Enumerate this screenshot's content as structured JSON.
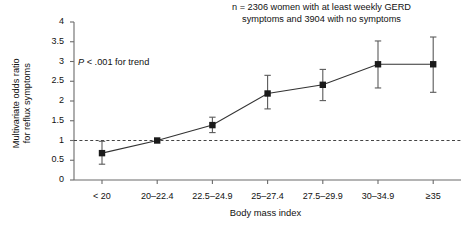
{
  "figure": {
    "annotation_note": "n = 2306 women with at least weekly GERD\nsymptoms and 3904 with no symptoms",
    "pvalue_italic": "P",
    "pvalue_rest": " < .001 for trend"
  },
  "chart_data": {
    "type": "line",
    "title": "",
    "subtitle": "n = 2306 women with at least weekly GERD symptoms and 3904 with no symptoms",
    "xlabel": "Body mass index",
    "ylabel": "Multivariate odds ratio\nfor reflux symptoms",
    "ylabel_lines": [
      "Multivariate odds ratio",
      "for reflux symptoms"
    ],
    "categories": [
      "< 20",
      "20–22.4",
      "22.5–24.9",
      "25–27.4",
      "27.5–29.9",
      "30–34.9",
      "≥35"
    ],
    "values": [
      0.68,
      1.0,
      1.39,
      2.19,
      2.41,
      2.93,
      2.93
    ],
    "ci_low": [
      0.4,
      1.0,
      1.2,
      1.8,
      2.01,
      2.33,
      2.22
    ],
    "ci_high": [
      0.98,
      1.0,
      1.59,
      2.65,
      2.8,
      3.52,
      3.62
    ],
    "ylim": [
      0,
      4
    ],
    "yticks": [
      "0",
      "0.5",
      "1",
      "1.5",
      "2",
      "2.5",
      "3",
      "3.5",
      "4"
    ],
    "ytick_values": [
      0,
      0.5,
      1,
      1.5,
      2,
      2.5,
      3,
      3.5,
      4
    ],
    "reference_line": 1,
    "reference_line_style": "dashed",
    "annotation": "P < .001 for trend",
    "grid": false,
    "legend": "none",
    "marker": "filled-square",
    "series_color": "#1a1a1a",
    "axis_color": "#6b6b6b"
  }
}
